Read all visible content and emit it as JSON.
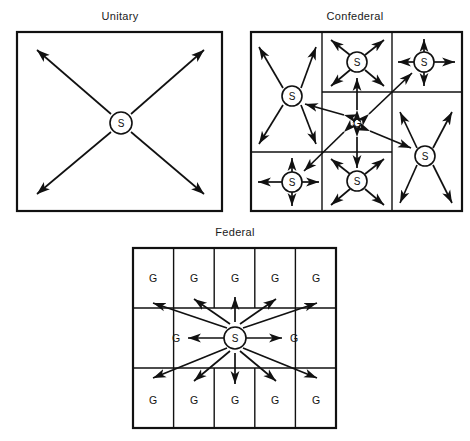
{
  "figure": {
    "caption": "",
    "background_color": "#ffffff",
    "line_color": "#111111",
    "text_color": "#1a1a1a"
  },
  "panels": [
    {
      "id": "unitary",
      "title": "Unitary",
      "description": "Single sovereign center with authority radiating outward to four corners",
      "center_node": {
        "label": "S",
        "shape": "circle"
      },
      "subdivisions": 0,
      "arrow_count": 4,
      "arrow_style": "single-headed outward"
    },
    {
      "id": "confederal",
      "title": "Confederal",
      "description": "Six sovereign states each radiating authority, linked to a weak central government by two-way arrows",
      "center_node": {
        "label": "G",
        "shape": "plain"
      },
      "state_nodes": [
        {
          "label": "S",
          "position": "left-upper",
          "arrow_style": "diagonal",
          "arrow_count": 4
        },
        {
          "label": "S",
          "position": "middle-top",
          "arrow_style": "diagonal",
          "arrow_count": 4
        },
        {
          "label": "S",
          "position": "right-top",
          "arrow_style": "cardinal",
          "arrow_count": 4
        },
        {
          "label": "S",
          "position": "left-lower",
          "arrow_style": "cardinal",
          "arrow_count": 4
        },
        {
          "label": "S",
          "position": "middle-bottom",
          "arrow_style": "diagonal",
          "arrow_count": 4
        },
        {
          "label": "S",
          "position": "right-lower",
          "arrow_style": "diagonal",
          "arrow_count": 4
        }
      ],
      "center_links": {
        "count": 6,
        "arrow_style": "double-headed"
      }
    },
    {
      "id": "federal",
      "title": "Federal",
      "description": "Central sovereign authority radiating to twelve constituent governments arranged in a grid",
      "center_node": {
        "label": "S",
        "shape": "circle"
      },
      "grid": {
        "columns": 5,
        "rows": 3,
        "top_row": [
          "G",
          "G",
          "G",
          "G",
          "G"
        ],
        "middle_row": [
          "G",
          "S",
          "G"
        ],
        "bottom_row": [
          "G",
          "G",
          "G",
          "G",
          "G"
        ]
      },
      "arrow_count": 12,
      "arrow_style": "single-headed outward"
    }
  ],
  "legend": {
    "S": "Sovereign authority",
    "G": "Constituent government"
  }
}
